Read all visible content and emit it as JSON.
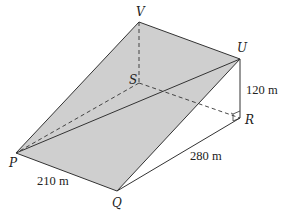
{
  "figure": {
    "type": "3D wedge / inclined plane diagram",
    "shaded_face_color": "#cfcfcf",
    "line_color": "#333333",
    "vertices": {
      "V": {
        "label": "V",
        "x": 139,
        "y": 22
      },
      "U": {
        "label": "U",
        "x": 240,
        "y": 59
      },
      "S": {
        "label": "S",
        "x": 139,
        "y": 83
      },
      "R": {
        "label": "R",
        "x": 240,
        "y": 118
      },
      "P": {
        "label": "P",
        "x": 16,
        "y": 153
      },
      "Q": {
        "label": "Q",
        "x": 117,
        "y": 191
      }
    },
    "measurements": {
      "UR": "120 m",
      "QR": "280 m",
      "PQ": "210 m"
    }
  }
}
